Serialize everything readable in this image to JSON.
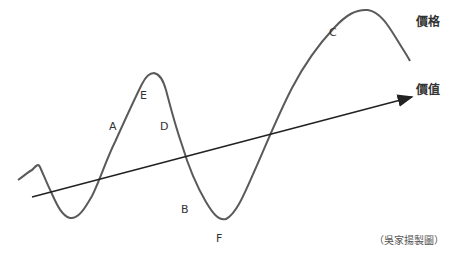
{
  "diagram": {
    "curve_label": "價格",
    "line_label": "價值",
    "point_labels": {
      "A": "A",
      "B": "B",
      "C": "C",
      "D": "D",
      "E": "E",
      "F": "F"
    },
    "credit": "（吳家揚製圖）",
    "colors": {
      "curve": "#555555",
      "line": "#222222",
      "text": "#333333"
    }
  }
}
